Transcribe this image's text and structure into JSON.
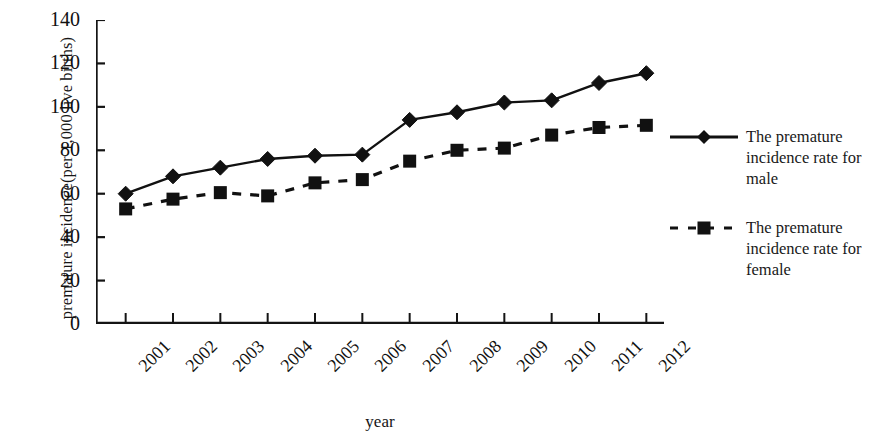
{
  "chart_data": {
    "type": "line",
    "title": "",
    "xlabel": "year",
    "ylabel": "premature incidence(per 1,000 live births)",
    "categories": [
      "2001",
      "2002",
      "2003",
      "2004",
      "2005",
      "2006",
      "2007",
      "2008",
      "2009",
      "2010",
      "2011",
      "2012"
    ],
    "ylim": [
      0,
      140
    ],
    "y_ticks": [
      0,
      20,
      40,
      60,
      80,
      100,
      120,
      140
    ],
    "grid": false,
    "legend_position": "right",
    "series": [
      {
        "name": "The premature incidence rate for male",
        "marker": "diamond",
        "line_style": "solid",
        "color": "#111111",
        "values": [
          60,
          68,
          72,
          76,
          77.5,
          78,
          94,
          97.5,
          102,
          103,
          111,
          115.5
        ]
      },
      {
        "name": "The premature incidence rate for female",
        "marker": "square",
        "line_style": "dashed",
        "color": "#111111",
        "values": [
          53,
          57.5,
          60.5,
          59,
          65,
          66.5,
          75,
          80,
          81,
          87,
          90.5,
          91.5
        ]
      }
    ]
  },
  "axes": {
    "y_title": "premature incidence(per 1,000 live births)",
    "x_title": "year"
  },
  "legend": {
    "entries": [
      {
        "label": "The premature incidence rate for male",
        "marker": "diamond-line-marker",
        "style": "solid"
      },
      {
        "label": "The premature incidence rate for female",
        "marker": "square-line-marker",
        "style": "dashed"
      }
    ]
  }
}
